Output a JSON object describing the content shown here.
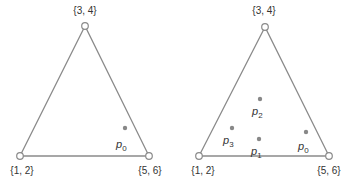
{
  "diagrams": [
    {
      "name": "left-triangle",
      "vertices": [
        {
          "label": "{3, 4}",
          "x": 85,
          "y": 26,
          "lx": 85,
          "ly": 14
        },
        {
          "label": "{1, 2}",
          "x": 20,
          "y": 156,
          "lx": 22,
          "ly": 174
        },
        {
          "label": "{5, 6}",
          "x": 149,
          "y": 156,
          "lx": 150,
          "ly": 174
        }
      ],
      "points": [
        {
          "base": "p",
          "sub": "0",
          "x": 125,
          "y": 128,
          "lx": 116,
          "ly": 148
        }
      ]
    },
    {
      "name": "right-triangle",
      "vertices": [
        {
          "label": "{3, 4}",
          "x": 265,
          "y": 27,
          "lx": 264,
          "ly": 14
        },
        {
          "label": "{1, 2}",
          "x": 199,
          "y": 156,
          "lx": 203,
          "ly": 174
        },
        {
          "label": "{5, 6}",
          "x": 329,
          "y": 156,
          "lx": 329,
          "ly": 174
        }
      ],
      "points": [
        {
          "base": "p",
          "sub": "2",
          "x": 260,
          "y": 99,
          "lx": 252,
          "ly": 115
        },
        {
          "base": "p",
          "sub": "3",
          "x": 232,
          "y": 128,
          "lx": 223,
          "ly": 144
        },
        {
          "base": "p",
          "sub": "1",
          "x": 259,
          "y": 139,
          "lx": 251,
          "ly": 155
        },
        {
          "base": "p",
          "sub": "0",
          "x": 306,
          "y": 132,
          "lx": 298,
          "ly": 150
        }
      ]
    }
  ],
  "colors": {
    "edge": "#8a8a8a",
    "dot": "#888888",
    "text": "#333333"
  }
}
